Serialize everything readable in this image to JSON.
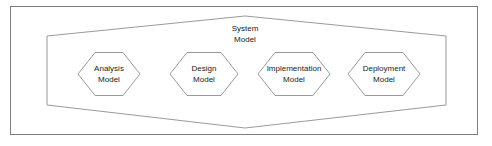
{
  "figure": {
    "type": "uml-package-diagram",
    "frame": {
      "border_color": "#7d7d7d",
      "fill": "#ffffff"
    }
  },
  "container": {
    "name": "system-model-container",
    "shape": "hexagon",
    "label_line1": "System",
    "label_line2": "Model",
    "stroke": "#9a9a9a",
    "fill": "#ffffff"
  },
  "nodes": [
    {
      "id": "analysis-model",
      "shape": "hexagon",
      "label_line1": "Analysis",
      "label_line2": "Model",
      "stroke": "#9a9a9a",
      "fill": "#ffffff"
    },
    {
      "id": "design-model",
      "shape": "hexagon",
      "label_line1": "Design",
      "label_line2": "Model",
      "stroke": "#9a9a9a",
      "fill": "#ffffff"
    },
    {
      "id": "implementation-model",
      "shape": "hexagon",
      "label_line1": "Implementation",
      "label_line2": "Model",
      "stroke": "#9a9a9a",
      "fill": "#ffffff"
    },
    {
      "id": "deployment-model",
      "shape": "hexagon",
      "label_line1": "Deployment",
      "label_line2": "Model",
      "stroke": "#9a9a9a",
      "fill": "#ffffff"
    }
  ]
}
